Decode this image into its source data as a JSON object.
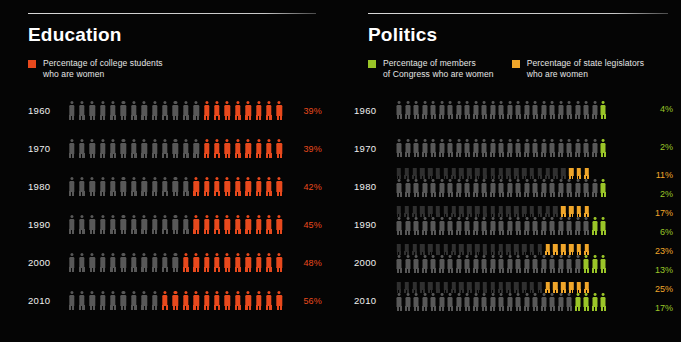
{
  "background_color": "#050505",
  "colors": {
    "inactive_figure": "#585858",
    "inactive_figure_dim": "#3f3f3f",
    "education_accent": "#e8491d",
    "congress_accent": "#9ac528",
    "legislators_accent": "#f0a62a",
    "title_text": "#ffffff",
    "legend_text": "#e6e6e6",
    "year_text": "#f0f0f0",
    "rule": "#d0d0d0"
  },
  "panels": [
    {
      "id": "education",
      "title": "Education",
      "figures_per_row": 21,
      "legend": [
        {
          "swatch_color": "#e8491d",
          "label": "Percentage of college students\nwho are women",
          "series_key": "college_students"
        }
      ],
      "rows": [
        {
          "year": "1960",
          "series": [
            {
              "key": "college_students",
              "value": 39,
              "value_label": "39%",
              "color": "#e8491d",
              "filled": 8
            }
          ]
        },
        {
          "year": "1970",
          "series": [
            {
              "key": "college_students",
              "value": 39,
              "value_label": "39%",
              "color": "#e8491d",
              "filled": 8
            }
          ]
        },
        {
          "year": "1980",
          "series": [
            {
              "key": "college_students",
              "value": 42,
              "value_label": "42%",
              "color": "#e8491d",
              "filled": 9
            }
          ]
        },
        {
          "year": "1990",
          "series": [
            {
              "key": "college_students",
              "value": 45,
              "value_label": "45%",
              "color": "#e8491d",
              "filled": 9
            }
          ]
        },
        {
          "year": "2000",
          "series": [
            {
              "key": "college_students",
              "value": 48,
              "value_label": "48%",
              "color": "#e8491d",
              "filled": 10
            }
          ]
        },
        {
          "year": "2010",
          "series": [
            {
              "key": "college_students",
              "value": 56,
              "value_label": "56%",
              "color": "#e8491d",
              "filled": 12
            }
          ]
        }
      ]
    },
    {
      "id": "politics",
      "title": "Politics",
      "figures_per_row": 25,
      "legend": [
        {
          "swatch_color": "#9ac528",
          "label": "Percentage of members\nof Congress who are women",
          "series_key": "congress"
        },
        {
          "swatch_color": "#f0a62a",
          "label": "Percentage of state legislators\nwho are women",
          "series_key": "state_legislators"
        }
      ],
      "rows": [
        {
          "year": "1960",
          "series": [
            {
              "key": "congress",
              "value": 4,
              "value_label": "4%",
              "color": "#9ac528",
              "filled": 1
            }
          ]
        },
        {
          "year": "1970",
          "series": [
            {
              "key": "congress",
              "value": 2,
              "value_label": "2%",
              "color": "#9ac528",
              "filled": 1
            }
          ]
        },
        {
          "year": "1980",
          "series": [
            {
              "key": "state_legislators",
              "value": 11,
              "value_label": "11%",
              "color": "#f0a62a",
              "filled": 3
            },
            {
              "key": "congress",
              "value": 2,
              "value_label": "2%",
              "color": "#9ac528",
              "filled": 1
            }
          ]
        },
        {
          "year": "1990",
          "series": [
            {
              "key": "state_legislators",
              "value": 17,
              "value_label": "17%",
              "color": "#f0a62a",
              "filled": 4
            },
            {
              "key": "congress",
              "value": 6,
              "value_label": "6%",
              "color": "#9ac528",
              "filled": 2
            }
          ]
        },
        {
          "year": "2000",
          "series": [
            {
              "key": "state_legislators",
              "value": 23,
              "value_label": "23%",
              "color": "#f0a62a",
              "filled": 6
            },
            {
              "key": "congress",
              "value": 13,
              "value_label": "13%",
              "color": "#9ac528",
              "filled": 3
            }
          ]
        },
        {
          "year": "2010",
          "series": [
            {
              "key": "state_legislators",
              "value": 25,
              "value_label": "25%",
              "color": "#f0a62a",
              "filled": 6
            },
            {
              "key": "congress",
              "value": 17,
              "value_label": "17%",
              "color": "#9ac528",
              "filled": 4
            }
          ]
        }
      ]
    }
  ],
  "chart_data": {
    "type": "bar",
    "subtitle": "",
    "xlabel": "",
    "ylabel": "",
    "categories": [
      "1960",
      "1970",
      "1980",
      "1990",
      "2000",
      "2010"
    ],
    "series": [
      {
        "name": "Percentage of college students who are women",
        "values": [
          39,
          39,
          42,
          45,
          48,
          56
        ],
        "color": "#e8491d",
        "panel": "Education",
        "unit": "%"
      },
      {
        "name": "Percentage of members of Congress who are women",
        "values": [
          4,
          2,
          2,
          6,
          13,
          17
        ],
        "color": "#9ac528",
        "panel": "Politics",
        "unit": "%"
      },
      {
        "name": "Percentage of state legislators who are women",
        "values": [
          null,
          null,
          11,
          17,
          23,
          25
        ],
        "color": "#f0a62a",
        "panel": "Politics",
        "unit": "%"
      }
    ],
    "ylim": [
      0,
      100
    ],
    "grid": false,
    "legend_position": "top"
  }
}
